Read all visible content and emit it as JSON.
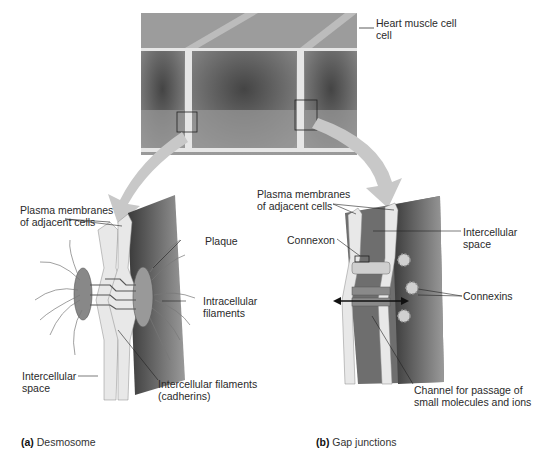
{
  "figure": {
    "top_panel": {
      "label": "Heart muscle cell"
    },
    "desmosome": {
      "caption_letter": "(a)",
      "caption_text": "Desmosome",
      "labels": {
        "plasma_membranes_1": "Plasma membranes",
        "plasma_membranes_2": "of adjacent cells",
        "plaque": "Plaque",
        "intracellular_filaments_1": "Intracellular",
        "intracellular_filaments_2": "filaments",
        "intercellular_space_1": "Intercellular",
        "intercellular_space_2": "space",
        "cadherins_1": "Intercellular filaments",
        "cadherins_2": "(cadherins)"
      }
    },
    "gap_junction": {
      "caption_letter": "(b)",
      "caption_text": "Gap junctions",
      "labels": {
        "plasma_membranes_1": "Plasma membranes",
        "plasma_membranes_2": "of adjacent cells",
        "connexon": "Connexon",
        "intercellular_space_1": "Intercellular",
        "intercellular_space_2": "space",
        "connexins": "Connexins",
        "channel_1": "Channel for passage of",
        "channel_2": "small molecules and ions"
      }
    },
    "colors": {
      "cell_dark": "#5a5a5a",
      "cell_mid": "#8a8a8a",
      "membrane": "#e8e8e8",
      "arrow": "#c8c8c8"
    }
  }
}
